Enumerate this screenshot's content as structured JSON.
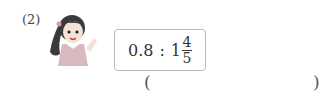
{
  "problem": {
    "number": "(2)",
    "ratio": {
      "left": "0.8",
      "separator": ":",
      "right_whole": "1",
      "right_numerator": "4",
      "right_denominator": "5"
    },
    "answer_open": "(",
    "answer_close": ")",
    "illustration": "girl-waving"
  }
}
